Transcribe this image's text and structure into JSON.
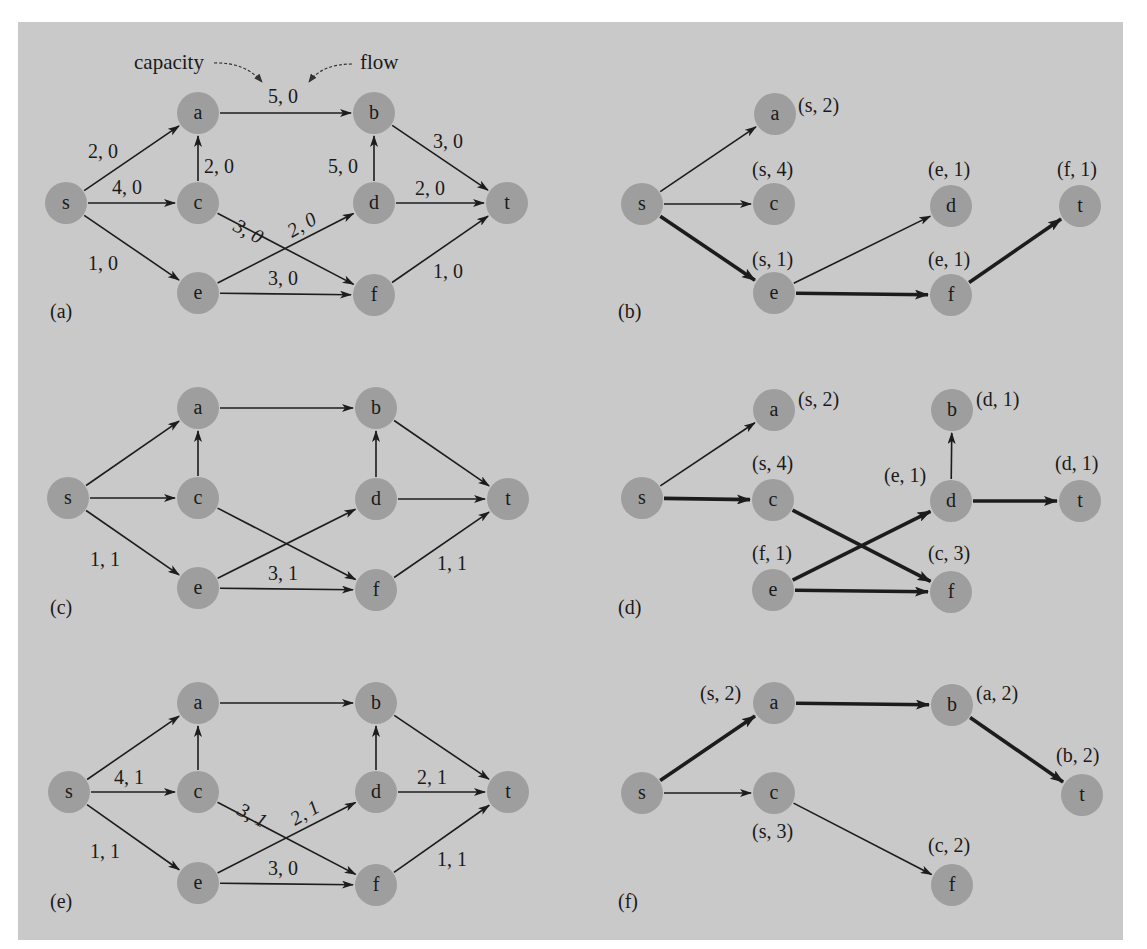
{
  "figure": {
    "background": "#c9c9c9",
    "node_color": "#9e9e9e",
    "edge_color": "#1c1c1c",
    "node_radius": 21,
    "annotation": {
      "capacity_label": "capacity",
      "flow_label": "flow",
      "example_edge_label": "5, 0"
    }
  },
  "panels": [
    {
      "id": "a",
      "label": "(a)",
      "label_pos": [
        50,
        318
      ],
      "nodes": [
        {
          "id": "s",
          "x": 66,
          "y": 203
        },
        {
          "id": "a",
          "x": 198,
          "y": 113
        },
        {
          "id": "c",
          "x": 198,
          "y": 203
        },
        {
          "id": "e",
          "x": 198,
          "y": 293
        },
        {
          "id": "b",
          "x": 374,
          "y": 113
        },
        {
          "id": "d",
          "x": 374,
          "y": 203
        },
        {
          "id": "f",
          "x": 374,
          "y": 295
        },
        {
          "id": "t",
          "x": 507,
          "y": 203
        }
      ],
      "edges": [
        {
          "from": "s",
          "to": "a",
          "style": "thin",
          "label": "2, 0",
          "lx": 88,
          "ly": 158
        },
        {
          "from": "s",
          "to": "c",
          "style": "thin",
          "label": "4, 0",
          "lx": 112,
          "ly": 194
        },
        {
          "from": "s",
          "to": "e",
          "style": "thin",
          "label": "1, 0",
          "lx": 88,
          "ly": 270
        },
        {
          "from": "c",
          "to": "a",
          "style": "thin",
          "label": "2, 0",
          "lx": 204,
          "ly": 173
        },
        {
          "from": "a",
          "to": "b",
          "style": "thin",
          "label": "5, 0",
          "lx": 268,
          "ly": 103
        },
        {
          "from": "c",
          "to": "f",
          "style": "thin",
          "label": "3, 0",
          "lx": 232,
          "ly": 230,
          "rot": 28
        },
        {
          "from": "e",
          "to": "d",
          "style": "thin",
          "label": "2, 0",
          "lx": 292,
          "ly": 238,
          "rot": -30
        },
        {
          "from": "e",
          "to": "f",
          "style": "thin",
          "label": "3, 0",
          "lx": 268,
          "ly": 285
        },
        {
          "from": "d",
          "to": "b",
          "style": "thin",
          "label": "5, 0",
          "lx": 328,
          "ly": 173
        },
        {
          "from": "b",
          "to": "t",
          "style": "thin",
          "label": "3, 0",
          "lx": 433,
          "ly": 148
        },
        {
          "from": "d",
          "to": "t",
          "style": "thin",
          "label": "2, 0",
          "lx": 415,
          "ly": 195
        },
        {
          "from": "f",
          "to": "t",
          "style": "thin",
          "label": "1, 0",
          "lx": 433,
          "ly": 278
        }
      ],
      "node_labels": []
    },
    {
      "id": "b",
      "label": "(b)",
      "label_pos": [
        618,
        318
      ],
      "nodes": [
        {
          "id": "s",
          "x": 642,
          "y": 204
        },
        {
          "id": "a",
          "x": 775,
          "y": 114
        },
        {
          "id": "c",
          "x": 774,
          "y": 204
        },
        {
          "id": "e",
          "x": 774,
          "y": 293
        },
        {
          "id": "d",
          "x": 951,
          "y": 206
        },
        {
          "id": "f",
          "x": 951,
          "y": 295
        },
        {
          "id": "t",
          "x": 1080,
          "y": 206
        }
      ],
      "edges": [
        {
          "from": "s",
          "to": "a",
          "style": "thin"
        },
        {
          "from": "s",
          "to": "c",
          "style": "thin"
        },
        {
          "from": "s",
          "to": "e",
          "style": "bold"
        },
        {
          "from": "e",
          "to": "d",
          "style": "thin"
        },
        {
          "from": "e",
          "to": "f",
          "style": "bold"
        },
        {
          "from": "f",
          "to": "t",
          "style": "bold"
        }
      ],
      "node_labels": [
        {
          "node": "a",
          "text": "(s, 2)",
          "x": 798,
          "y": 112
        },
        {
          "node": "c",
          "text": "(s, 4)",
          "x": 752,
          "y": 176
        },
        {
          "node": "d",
          "text": "(e, 1)",
          "x": 928,
          "y": 176
        },
        {
          "node": "t",
          "text": "(f, 1)",
          "x": 1057,
          "y": 176
        },
        {
          "node": "e",
          "text": "(s, 1)",
          "x": 752,
          "y": 266
        },
        {
          "node": "f",
          "text": "(e, 1)",
          "x": 928,
          "y": 266
        }
      ]
    },
    {
      "id": "c",
      "label": "(c)",
      "label_pos": [
        50,
        614
      ],
      "nodes": [
        {
          "id": "s",
          "x": 68,
          "y": 498
        },
        {
          "id": "a",
          "x": 198,
          "y": 408
        },
        {
          "id": "c",
          "x": 198,
          "y": 498
        },
        {
          "id": "e",
          "x": 198,
          "y": 588
        },
        {
          "id": "b",
          "x": 376,
          "y": 408
        },
        {
          "id": "d",
          "x": 376,
          "y": 499
        },
        {
          "id": "f",
          "x": 376,
          "y": 590
        },
        {
          "id": "t",
          "x": 508,
          "y": 499
        }
      ],
      "edges": [
        {
          "from": "s",
          "to": "a",
          "style": "thin"
        },
        {
          "from": "s",
          "to": "c",
          "style": "thin"
        },
        {
          "from": "s",
          "to": "e",
          "style": "thin",
          "label": "1, 1",
          "lx": 90,
          "ly": 566
        },
        {
          "from": "c",
          "to": "a",
          "style": "thin"
        },
        {
          "from": "a",
          "to": "b",
          "style": "thin"
        },
        {
          "from": "c",
          "to": "f",
          "style": "thin"
        },
        {
          "from": "e",
          "to": "d",
          "style": "thin"
        },
        {
          "from": "e",
          "to": "f",
          "style": "thin",
          "label": "3, 1",
          "lx": 268,
          "ly": 580
        },
        {
          "from": "d",
          "to": "b",
          "style": "thin"
        },
        {
          "from": "b",
          "to": "t",
          "style": "thin"
        },
        {
          "from": "d",
          "to": "t",
          "style": "thin"
        },
        {
          "from": "f",
          "to": "t",
          "style": "thin",
          "label": "1, 1",
          "lx": 437,
          "ly": 570
        }
      ],
      "node_labels": []
    },
    {
      "id": "d",
      "label": "(d)",
      "label_pos": [
        618,
        614
      ],
      "nodes": [
        {
          "id": "s",
          "x": 642,
          "y": 498
        },
        {
          "id": "a",
          "x": 774,
          "y": 410
        },
        {
          "id": "c",
          "x": 773,
          "y": 500
        },
        {
          "id": "e",
          "x": 773,
          "y": 590
        },
        {
          "id": "b",
          "x": 952,
          "y": 410
        },
        {
          "id": "d",
          "x": 951,
          "y": 501
        },
        {
          "id": "f",
          "x": 951,
          "y": 592
        },
        {
          "id": "t",
          "x": 1080,
          "y": 501
        }
      ],
      "edges": [
        {
          "from": "s",
          "to": "a",
          "style": "thin"
        },
        {
          "from": "s",
          "to": "c",
          "style": "bold"
        },
        {
          "from": "c",
          "to": "f",
          "style": "bold"
        },
        {
          "from": "e",
          "to": "d",
          "style": "bold"
        },
        {
          "from": "e",
          "to": "f",
          "style": "bold"
        },
        {
          "from": "d",
          "to": "b",
          "style": "thin"
        },
        {
          "from": "d",
          "to": "t",
          "style": "bold"
        }
      ],
      "node_labels": [
        {
          "node": "a",
          "text": "(s, 2)",
          "x": 798,
          "y": 406
        },
        {
          "node": "b",
          "text": "(d, 1)",
          "x": 976,
          "y": 406
        },
        {
          "node": "c",
          "text": "(s, 4)",
          "x": 752,
          "y": 470
        },
        {
          "node": "d",
          "text": "(e, 1)",
          "x": 884,
          "y": 482
        },
        {
          "node": "t",
          "text": "(d, 1)",
          "x": 1055,
          "y": 470
        },
        {
          "node": "e",
          "text": "(f, 1)",
          "x": 752,
          "y": 560
        },
        {
          "node": "f",
          "text": "(c, 3)",
          "x": 928,
          "y": 560
        }
      ]
    },
    {
      "id": "e",
      "label": "(e)",
      "label_pos": [
        50,
        908
      ],
      "nodes": [
        {
          "id": "s",
          "x": 69,
          "y": 792
        },
        {
          "id": "a",
          "x": 198,
          "y": 703
        },
        {
          "id": "c",
          "x": 198,
          "y": 792
        },
        {
          "id": "e",
          "x": 198,
          "y": 883
        },
        {
          "id": "b",
          "x": 376,
          "y": 703
        },
        {
          "id": "d",
          "x": 376,
          "y": 792
        },
        {
          "id": "f",
          "x": 376,
          "y": 885
        },
        {
          "id": "t",
          "x": 508,
          "y": 792
        }
      ],
      "edges": [
        {
          "from": "s",
          "to": "a",
          "style": "thin"
        },
        {
          "from": "s",
          "to": "c",
          "style": "thin",
          "label": "4, 1",
          "lx": 114,
          "ly": 784
        },
        {
          "from": "s",
          "to": "e",
          "style": "thin",
          "label": "1, 1",
          "lx": 90,
          "ly": 858
        },
        {
          "from": "c",
          "to": "a",
          "style": "thin"
        },
        {
          "from": "a",
          "to": "b",
          "style": "thin"
        },
        {
          "from": "c",
          "to": "f",
          "style": "thin",
          "label": "3, 1",
          "lx": 236,
          "ly": 814,
          "rot": 28
        },
        {
          "from": "e",
          "to": "d",
          "style": "thin",
          "label": "2, 1",
          "lx": 295,
          "ly": 826,
          "rot": -30
        },
        {
          "from": "e",
          "to": "f",
          "style": "thin",
          "label": "3, 0",
          "lx": 268,
          "ly": 875
        },
        {
          "from": "d",
          "to": "b",
          "style": "thin"
        },
        {
          "from": "b",
          "to": "t",
          "style": "thin"
        },
        {
          "from": "d",
          "to": "t",
          "style": "thin",
          "label": "2, 1",
          "lx": 417,
          "ly": 784
        },
        {
          "from": "f",
          "to": "t",
          "style": "thin",
          "label": "1, 1",
          "lx": 437,
          "ly": 866
        }
      ],
      "node_labels": []
    },
    {
      "id": "f",
      "label": "(f)",
      "label_pos": [
        618,
        908
      ],
      "nodes": [
        {
          "id": "s",
          "x": 642,
          "y": 793
        },
        {
          "id": "a",
          "x": 774,
          "y": 703
        },
        {
          "id": "b",
          "x": 952,
          "y": 705
        },
        {
          "id": "c",
          "x": 774,
          "y": 793
        },
        {
          "id": "t",
          "x": 1082,
          "y": 795
        },
        {
          "id": "f",
          "x": 952,
          "y": 885
        }
      ],
      "edges": [
        {
          "from": "s",
          "to": "a",
          "style": "bold"
        },
        {
          "from": "a",
          "to": "b",
          "style": "bold"
        },
        {
          "from": "b",
          "to": "t",
          "style": "bold"
        },
        {
          "from": "s",
          "to": "c",
          "style": "thin"
        },
        {
          "from": "c",
          "to": "f",
          "style": "thin"
        }
      ],
      "node_labels": [
        {
          "node": "a",
          "text": "(s, 2)",
          "x": 700,
          "y": 700
        },
        {
          "node": "b",
          "text": "(a, 2)",
          "x": 976,
          "y": 700
        },
        {
          "node": "c",
          "text": "(s, 3)",
          "x": 752,
          "y": 838
        },
        {
          "node": "t",
          "text": "(b, 2)",
          "x": 1056,
          "y": 762
        },
        {
          "node": "f",
          "text": "(c, 2)",
          "x": 928,
          "y": 852
        }
      ]
    }
  ]
}
